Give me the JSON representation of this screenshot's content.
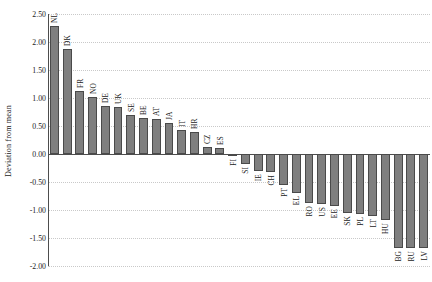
{
  "chart_data": {
    "type": "bar",
    "title": "",
    "xlabel": "",
    "ylabel": "Deviation from mean",
    "ylim": [
      -2.0,
      2.5
    ],
    "ytick_step": 0.5,
    "ytick_labels": [
      "2.50",
      "2.00",
      "1.50",
      "1.00",
      "0.50",
      "0.00",
      "-0.50",
      "-1.00",
      "-1.50",
      "-2.00"
    ],
    "ytick_values": [
      2.5,
      2.0,
      1.5,
      1.0,
      0.5,
      0.0,
      -0.5,
      -1.0,
      -1.5,
      -2.0
    ],
    "grid": true,
    "legend": "none",
    "bar_color": "#7f7f7f",
    "bar_edge_color": "#4a4a4a",
    "axis_color": "#4d4d4d",
    "grid_color": "#c9c9c9",
    "categories": [
      "NL",
      "DK",
      "FR",
      "NO",
      "DE",
      "UK",
      "SE",
      "BE",
      "AT",
      "JA",
      "IT",
      "HR",
      "CZ",
      "ES",
      "FI",
      "SI",
      "IE",
      "CH",
      "PT",
      "EL",
      "RO",
      "US",
      "EE",
      "SK",
      "PL",
      "LT",
      "HU",
      "BG",
      "RU",
      "LV"
    ],
    "values": [
      2.28,
      1.88,
      1.12,
      1.02,
      0.85,
      0.84,
      0.7,
      0.65,
      0.63,
      0.55,
      0.42,
      0.4,
      0.12,
      0.1,
      -0.04,
      -0.18,
      -0.3,
      -0.32,
      -0.55,
      -0.7,
      -0.88,
      -0.9,
      -0.92,
      -1.05,
      -1.08,
      -1.1,
      -1.18,
      -1.68,
      -1.68,
      -1.68
    ]
  }
}
